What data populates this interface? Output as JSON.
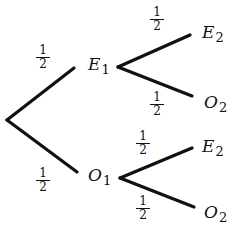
{
  "diagram": {
    "type": "probability-tree",
    "root": {
      "x": 7,
      "y": 120
    },
    "level1": [
      {
        "label": "E",
        "sub": "1",
        "prob_num": "1",
        "prob_den": "2"
      },
      {
        "label": "O",
        "sub": "1",
        "prob_num": "1",
        "prob_den": "2"
      }
    ],
    "level2": [
      {
        "parent": "E1",
        "label": "E",
        "sub": "2",
        "prob_num": "1",
        "prob_den": "2"
      },
      {
        "parent": "E1",
        "label": "O",
        "sub": "2",
        "prob_num": "1",
        "prob_den": "2"
      },
      {
        "parent": "O1",
        "label": "E",
        "sub": "2",
        "prob_num": "1",
        "prob_den": "2"
      },
      {
        "parent": "O1",
        "label": "O",
        "sub": "2",
        "prob_num": "1",
        "prob_den": "2"
      }
    ],
    "line_color": "#111111"
  }
}
